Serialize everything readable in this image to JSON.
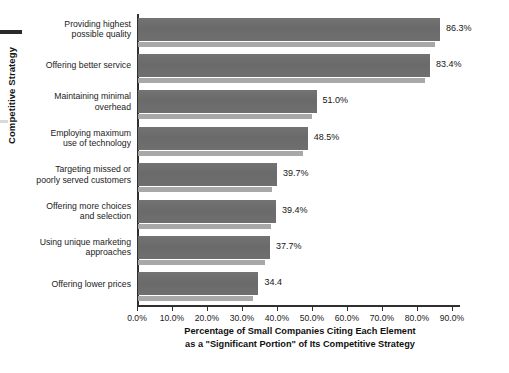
{
  "chart_data": {
    "type": "bar",
    "orientation": "horizontal",
    "title": "",
    "xlabel": "Percentage of Small Companies Citing Each Element as a \"Significant Portion\" of Its Competitive Strategy",
    "xlabel_line1": "Percentage of Small Companies Citing Each Element",
    "xlabel_line2": "as a \"Significant Portion\" of Its Competitive Strategy",
    "ylabel": "Competitive Strategy",
    "categories": [
      "Providing highest possible quality",
      "Offering better service",
      "Maintaining minimal overhead",
      "Employing maximum use of technology",
      "Targeting missed or poorly served customers",
      "Offering more choices and selection",
      "Using unique marketing approaches",
      "Offering lower prices"
    ],
    "category_lines": [
      [
        "Providing highest",
        "possible quality"
      ],
      [
        "Offering better service"
      ],
      [
        "Maintaining minimal",
        "overhead"
      ],
      [
        "Employing maximum",
        "use of technology"
      ],
      [
        "Targeting missed or",
        "poorly served customers"
      ],
      [
        "Offering more choices",
        "and selection"
      ],
      [
        "Using unique marketing",
        "approaches"
      ],
      [
        "Offering lower prices"
      ]
    ],
    "values": [
      86.3,
      83.4,
      51.0,
      48.5,
      39.7,
      39.4,
      37.7,
      34.4
    ],
    "value_labels": [
      "86.3%",
      "83.4%",
      "51.0%",
      "48.5%",
      "39.7%",
      "39.4%",
      "37.7%",
      "34.4"
    ],
    "xlim": [
      0,
      90
    ],
    "xticks": [
      0,
      10,
      20,
      30,
      40,
      50,
      60,
      70,
      80,
      90
    ],
    "xtick_labels": [
      "0.0%",
      "10.0%",
      "20.0%",
      "30.0%",
      "40.0%",
      "50.0%",
      "60.0%",
      "70.0%",
      "80.0%",
      "90.0%"
    ],
    "grid": false,
    "legend": "none",
    "bar_color": "#6e6e6e",
    "bar_shadow_color": "#a8a8a8",
    "axis_color": "#2f2f2f",
    "background": "#ffffff"
  }
}
